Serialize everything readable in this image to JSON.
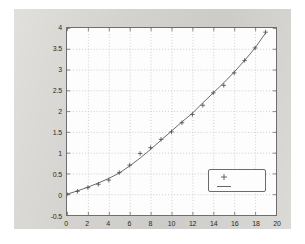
{
  "figure": {
    "background_color": "#d3d2ce",
    "axes_background_color": "#fdfdfd",
    "axes_border_color": "#6e6e6e",
    "grid_color": "#b9b9b9",
    "title": "",
    "outer_background_color": "#ffffff"
  },
  "chart_data": {
    "type": "scatter",
    "title": "",
    "xlabel": "",
    "ylabel": "",
    "xlim": [
      0,
      20
    ],
    "ylim": [
      -0.5,
      4
    ],
    "grid": true,
    "xticks": [
      0,
      2,
      4,
      6,
      8,
      10,
      12,
      14,
      16,
      18,
      20
    ],
    "xtick_labels": [
      "0",
      "2",
      "4",
      "6",
      "8",
      "10",
      "12",
      "14",
      "16",
      "18",
      "20"
    ],
    "yticks": [
      -0.5,
      0,
      0.5,
      1,
      1.5,
      2,
      2.5,
      3,
      3.5,
      4
    ],
    "ytick_labels": [
      "-0.5",
      "0",
      "0.5",
      "1",
      "1.5",
      "2",
      "2.5",
      "3",
      "3.5",
      "4"
    ],
    "legend": {
      "position": "lower-right",
      "entries": [
        {
          "label": "",
          "marker": "+",
          "style": "marker",
          "color": "#555555"
        },
        {
          "label": "",
          "marker": "-",
          "style": "line",
          "color": "#555555"
        }
      ]
    },
    "series": [
      {
        "name": "data",
        "style": "marker",
        "marker": "+",
        "color": "#4a4a4a",
        "x": [
          0,
          1,
          2,
          3,
          4,
          5,
          6,
          7,
          8,
          9,
          10,
          11,
          12,
          13,
          14,
          15,
          16,
          17,
          18,
          19
        ],
        "y": [
          0.0,
          0.07,
          0.16,
          0.24,
          0.34,
          0.52,
          0.7,
          0.98,
          1.12,
          1.32,
          1.5,
          1.72,
          1.92,
          2.14,
          2.44,
          2.62,
          2.92,
          3.22,
          3.52,
          3.9
        ]
      },
      {
        "name": "fit",
        "style": "line",
        "color": "#6a6a6a",
        "x": [
          0,
          1,
          2,
          3,
          4,
          5,
          6,
          7,
          8,
          9,
          10,
          11,
          12,
          13,
          14,
          15,
          16,
          17,
          18,
          19
        ],
        "y": [
          0.0,
          0.08,
          0.17,
          0.27,
          0.38,
          0.51,
          0.68,
          0.87,
          1.08,
          1.3,
          1.52,
          1.74,
          1.95,
          2.2,
          2.44,
          2.68,
          2.94,
          3.22,
          3.52,
          3.88
        ]
      }
    ]
  }
}
